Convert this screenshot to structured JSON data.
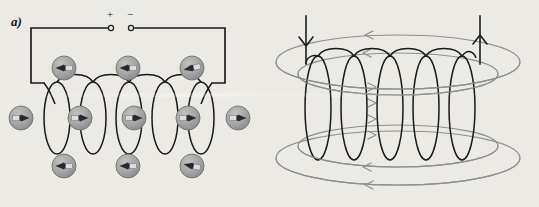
{
  "figure": {
    "width": 539,
    "height": 207,
    "background_color": "#eceae5"
  },
  "panels": [
    {
      "id": "a",
      "label": "a)",
      "title": "Solenoid with compass needles",
      "terminals": {
        "positive_label": "+",
        "negative_label": "−",
        "positive_x": 112,
        "negative_x": 131,
        "terminal_y": 28,
        "marker": "open-circle"
      },
      "circuit": {
        "wire_color": "#1a1a1a",
        "wire_width": 1.6,
        "left_x": 31,
        "right_x": 225,
        "top_y": 28,
        "bottom_y": 83
      },
      "coil": {
        "turns": 5,
        "loop_count": 5,
        "center_y": 118,
        "loop_width": 26,
        "loop_height": 72,
        "start_x": 44,
        "spacing": 36,
        "stroke_color": "#161616",
        "stroke_width": 1.5
      },
      "compasses": {
        "body_fill": "#9e9e9e",
        "body_stroke": "#6f6f6f",
        "needle_dark": "#2a2a2a",
        "needle_light": "#dcdcdc",
        "radius": 12,
        "rows": [
          {
            "name": "top-row",
            "y": 68,
            "direction": "left",
            "positions": [
              64,
              128,
              192
            ]
          },
          {
            "name": "middle-row",
            "y": 118,
            "direction": "right",
            "positions": [
              21,
              80,
              134,
              188,
              238
            ]
          },
          {
            "name": "bottom-row",
            "y": 166,
            "direction": "left",
            "positions": [
              64,
              128,
              192
            ]
          }
        ]
      }
    },
    {
      "id": "b",
      "label": "b)",
      "title": "Magnetic field lines around the solenoid",
      "coil": {
        "turns": 6,
        "center_y": 110,
        "loop_width": 26,
        "loop_height": 110,
        "start_x": 48,
        "spacing": 36,
        "stroke_color": "#161616",
        "stroke_width": 1.5
      },
      "leads": {
        "left_x": 36,
        "right_x": 210,
        "top_y": 22,
        "left_arrow_direction": "down",
        "right_arrow_direction": "up",
        "stroke_color": "#1a1a1a"
      },
      "field_lines": {
        "color": "#8d8d8d",
        "stroke_width": 1.2,
        "count": 4,
        "arrow_direction_outside": "left",
        "arrow_direction_inside": "right",
        "ellipses": [
          {
            "cx": 128,
            "cy": 62,
            "rx": 122,
            "ry": 27
          },
          {
            "cx": 128,
            "cy": 72,
            "rx": 100,
            "ry": 20
          },
          {
            "cx": 128,
            "cy": 148,
            "rx": 100,
            "ry": 20
          },
          {
            "cx": 128,
            "cy": 158,
            "rx": 122,
            "ry": 27
          }
        ]
      }
    }
  ]
}
